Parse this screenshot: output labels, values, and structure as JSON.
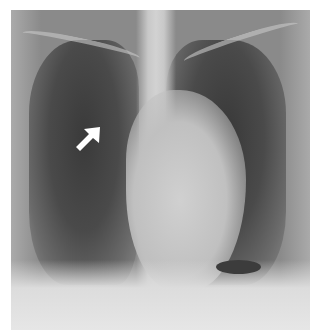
{
  "image": {
    "type": "chest-radiograph",
    "view": "frontal",
    "annotation": {
      "kind": "arrow",
      "color": "#ffffff",
      "direction": "up-right"
    }
  }
}
